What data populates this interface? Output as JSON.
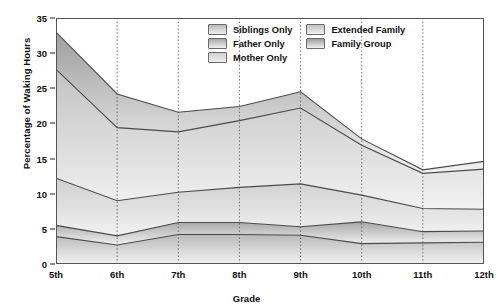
{
  "chart_data": {
    "type": "area",
    "title": "",
    "xlabel": "Grade",
    "ylabel": "Percentage of Waking Hours",
    "categories": [
      "5th",
      "6th",
      "7th",
      "8th",
      "9th",
      "10th",
      "11th",
      "12th"
    ],
    "ylim": [
      0,
      35
    ],
    "yticks": [
      0,
      5,
      10,
      15,
      20,
      25,
      30,
      35
    ],
    "stacked": true,
    "grid": "vertical-dotted",
    "legend_position": "top-right-inside",
    "series": [
      {
        "name": "Siblings Only",
        "color": "#b9b9b9",
        "values": [
          3.9,
          2.7,
          4.2,
          4.2,
          4.1,
          2.9,
          3.0,
          3.1
        ]
      },
      {
        "name": "Father Only",
        "color": "#a8a8a8",
        "values": [
          1.6,
          1.3,
          1.7,
          1.7,
          1.2,
          3.1,
          1.6,
          1.6
        ]
      },
      {
        "name": "Mother Only",
        "color": "#cfcfcf",
        "values": [
          6.7,
          5.0,
          4.3,
          5.0,
          6.1,
          3.8,
          3.3,
          3.1
        ]
      },
      {
        "name": "Extended Family",
        "color": "#c2c2c2",
        "values": [
          15.5,
          10.4,
          8.6,
          9.5,
          10.8,
          7.1,
          5.0,
          5.7
        ]
      },
      {
        "name": "Family Group",
        "color": "#9e9e9e",
        "values": [
          5.3,
          4.8,
          2.8,
          2.0,
          2.3,
          0.9,
          0.5,
          1.1
        ]
      }
    ],
    "cumulative_boundaries": {
      "siblings_only_top": [
        3.9,
        2.7,
        4.2,
        4.2,
        4.1,
        2.9,
        3.0,
        3.1
      ],
      "father_only_top": [
        5.5,
        4.0,
        5.9,
        5.9,
        5.3,
        6.0,
        4.6,
        4.7
      ],
      "mother_only_top": [
        12.2,
        9.0,
        10.2,
        10.9,
        11.4,
        9.8,
        7.9,
        7.8
      ],
      "extended_family_top": [
        27.7,
        19.4,
        18.8,
        20.4,
        22.2,
        16.9,
        12.9,
        13.5
      ],
      "family_group_top": [
        33.0,
        24.2,
        21.6,
        22.4,
        24.5,
        17.8,
        13.4,
        14.6
      ]
    }
  },
  "legend": {
    "column_left": [
      "Siblings Only",
      "Father Only",
      "Mother Only"
    ],
    "column_right": [
      "Extended Family",
      "Family Group"
    ]
  }
}
